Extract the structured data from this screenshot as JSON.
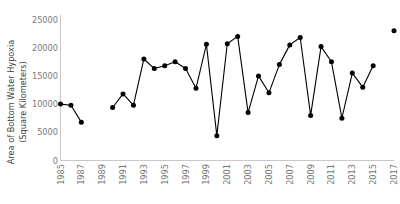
{
  "chart_data": {
    "type": "line",
    "title": "",
    "xlabel": "",
    "ylabel": "Area of Bottom Water Hypoxia (Square Kilometers)",
    "ylabel_line1": "Area of Bottom Water Hypoxia",
    "ylabel_line2": "(Square Kilometers)",
    "ylim": [
      0,
      25000
    ],
    "xlim": [
      1985,
      2017
    ],
    "grid": false,
    "legend": "none",
    "marker": "filled-circle",
    "line_color": "#000000",
    "marker_color": "#000000",
    "axis_color": "#c8c8c8",
    "tick_label_color": "#7a7a7a",
    "axis_label_color": "#3f3f3f",
    "x_tick_labels": [
      "1985",
      "1987",
      "1989",
      "1991",
      "1993",
      "1995",
      "1997",
      "1999",
      "2001",
      "2003",
      "2005",
      "2007",
      "2009",
      "2011",
      "2013",
      "2015",
      "2017"
    ],
    "x_tick_values": [
      1985,
      1987,
      1989,
      1991,
      1993,
      1995,
      1997,
      1999,
      2001,
      2003,
      2005,
      2007,
      2009,
      2011,
      2013,
      2015,
      2017
    ],
    "x_tick_rotation": 90,
    "y_tick_labels": [
      "0",
      "5000",
      "10000",
      "15000",
      "20000",
      "25000"
    ],
    "y_tick_values": [
      0,
      5000,
      10000,
      15000,
      20000,
      25000
    ],
    "x": [
      1985,
      1986,
      1987,
      1990,
      1991,
      1992,
      1993,
      1994,
      1995,
      1996,
      1997,
      1998,
      1999,
      2000,
      2001,
      2002,
      2003,
      2004,
      2005,
      2006,
      2007,
      2008,
      2009,
      2010,
      2011,
      2012,
      2013,
      2014,
      2015,
      2017
    ],
    "values": [
      10000,
      9800,
      6800,
      9400,
      11800,
      9800,
      18000,
      16300,
      16800,
      17500,
      16300,
      12800,
      20600,
      4400,
      20700,
      22000,
      8500,
      15000,
      12000,
      17000,
      20500,
      21800,
      8000,
      20200,
      17500,
      7500,
      15500,
      13000,
      16800,
      23000
    ],
    "missing_years": [
      1988,
      1989,
      2016
    ],
    "segments": [
      {
        "x": [
          1985,
          1986,
          1987
        ],
        "values": [
          10000,
          9800,
          6800
        ]
      },
      {
        "x": [
          1990,
          1991,
          1992,
          1993,
          1994,
          1995,
          1996,
          1997,
          1998,
          1999,
          2000,
          2001,
          2002,
          2003,
          2004,
          2005,
          2006,
          2007,
          2008,
          2009,
          2010,
          2011,
          2012,
          2013,
          2014,
          2015
        ],
        "values": [
          9400,
          11800,
          9800,
          18000,
          16300,
          16800,
          17500,
          16300,
          12800,
          20600,
          4400,
          20700,
          22000,
          8500,
          15000,
          12000,
          17000,
          20500,
          21800,
          8000,
          20200,
          17500,
          7500,
          15500,
          13000,
          16800
        ]
      },
      {
        "x": [
          2017
        ],
        "values": [
          23000
        ]
      }
    ]
  }
}
